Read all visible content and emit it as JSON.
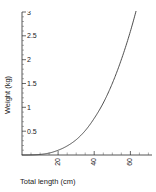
{
  "chart_data": {
    "type": "line",
    "title": "",
    "xlabel": "Total length (cm)",
    "ylabel": "Weight (kg)",
    "xlim": [
      0,
      72
    ],
    "ylim": [
      0,
      3
    ],
    "grid": false,
    "legend": "none",
    "x_ticks": [
      20,
      40,
      60
    ],
    "x_tick_labels": [
      "20",
      "40",
      "60"
    ],
    "x_tick_rotation": -90,
    "y_ticks": [
      0.5,
      1,
      1.5,
      2,
      2.5,
      3
    ],
    "y_tick_labels": [
      "0.5",
      "1",
      "1.5",
      "2",
      "2.5",
      "3"
    ],
    "series": [
      {
        "name": "length-weight curve",
        "x": [
          0,
          5,
          10,
          15,
          20,
          25,
          30,
          35,
          40,
          45,
          50,
          55,
          60,
          65,
          70,
          72
        ],
        "y": [
          0,
          0.002,
          0.012,
          0.04,
          0.1,
          0.19,
          0.32,
          0.51,
          0.77,
          1.09,
          1.5,
          2.0,
          2.59,
          3.29,
          4.12,
          4.48
        ]
      }
    ],
    "curve_color": "#3a3a3a",
    "axis_color": "#2a2a2a"
  },
  "axes": {
    "x_title": "Total length (cm)",
    "y_title": "Weight (kg)",
    "x_tick_0": "20",
    "x_tick_1": "40",
    "x_tick_2": "60",
    "y_tick_0": "0.5",
    "y_tick_1": "1",
    "y_tick_2": "1.5",
    "y_tick_3": "2",
    "y_tick_4": "2.5",
    "y_tick_5": "3"
  }
}
